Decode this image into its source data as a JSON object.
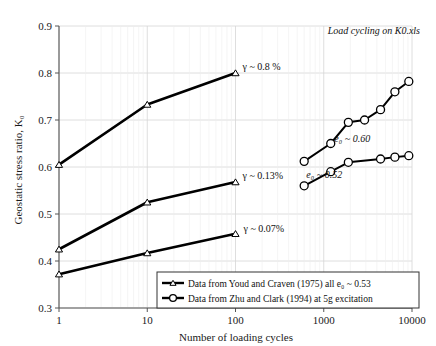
{
  "chart_data": {
    "type": "line",
    "title": "",
    "note": "Load cycling on K0.xls",
    "xlabel": "Number of loading cycles",
    "ylabel": "Geostatic stress ratio, K₀",
    "xscale": "log",
    "xlim": [
      1,
      10000
    ],
    "ylim": [
      0.3,
      0.9
    ],
    "yticks": [
      "0.3",
      "0.4",
      "0.5",
      "0.6",
      "0.7",
      "0.8",
      "0.9"
    ],
    "ytick_values": [
      0.3,
      0.4,
      0.5,
      0.6,
      0.7,
      0.8,
      0.9
    ],
    "xticks": [
      "1",
      "10",
      "100",
      "1000",
      "10000"
    ],
    "xtick_values": [
      1,
      10,
      100,
      1000,
      10000
    ],
    "grid": true,
    "legend_position": "bottom-right-inside",
    "series": [
      {
        "name": "Youd and Craven (1975), gamma ~ 0.8 %",
        "marker": "triangle",
        "annotation": "γ ~ 0.8 %",
        "x": [
          1,
          10,
          100
        ],
        "y": [
          0.605,
          0.733,
          0.8
        ]
      },
      {
        "name": "Youd and Craven (1975), gamma ~ 0.13%",
        "marker": "triangle",
        "annotation": "γ ~ 0.13%",
        "x": [
          1,
          10,
          100
        ],
        "y": [
          0.425,
          0.525,
          0.568
        ]
      },
      {
        "name": "Youd and Craven (1975), gamma ~ 0.07%",
        "marker": "triangle",
        "annotation": "γ ~ 0.07%",
        "x": [
          1,
          10,
          100
        ],
        "y": [
          0.372,
          0.417,
          0.458
        ]
      },
      {
        "name": "Zhu and Clark (1994), e0 ~ 0.60",
        "marker": "circle",
        "annotation": "e₀ ~ 0.60",
        "x": [
          600,
          1200,
          1900,
          2900,
          4400,
          6400,
          9200
        ],
        "y": [
          0.612,
          0.65,
          0.695,
          0.7,
          0.722,
          0.76,
          0.782
        ]
      },
      {
        "name": "Zhu and Clark (1994), e0 ~ 0.52",
        "marker": "circle",
        "annotation": "e₀ ~ 0.52",
        "x": [
          600,
          1200,
          1900,
          4400,
          6400,
          9200
        ],
        "y": [
          0.56,
          0.59,
          0.61,
          0.617,
          0.621,
          0.624
        ]
      }
    ],
    "legend": [
      {
        "marker": "triangle",
        "label_parts": [
          "Data from Youd and Craven (1975) all ",
          "e",
          "o",
          " ~ 0.53"
        ],
        "label": "Data from Youd and Craven (1975) all e₀ ~ 0.53"
      },
      {
        "marker": "circle",
        "label": "Data from Zhu and Clark (1994) at 5g excitation"
      }
    ],
    "colors": {
      "line": "#000000",
      "grid": "#d6d6d6",
      "axis": "#555555",
      "marker_fill": "#ffffff",
      "background": "#ffffff"
    }
  }
}
